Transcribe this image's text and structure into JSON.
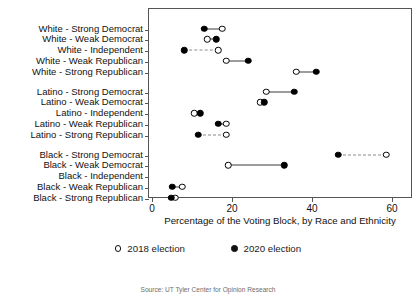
{
  "chart_data": {
    "type": "scatter",
    "subtype": "dumbbell",
    "title": "",
    "xlabel": "Percentage of the Voting Block, by Race and Ethnicity",
    "ylabel": "",
    "xlim": [
      0,
      62
    ],
    "xticks": [
      0,
      20,
      40,
      60
    ],
    "xticklabels": [
      "0",
      "20",
      "40",
      "60"
    ],
    "grid": false,
    "legend_position": "bottom",
    "source_note": "Source: UT Tyler Center for Opinion Research",
    "series": [
      {
        "name": "2018 election",
        "marker": "open-circle",
        "color": "#ffffff"
      },
      {
        "name": "2020 election",
        "marker": "filled-circle",
        "color": "#000000"
      }
    ],
    "categories": [
      "White - Strong Democrat",
      "White - Weak Democrat",
      "White - Independent",
      "White - Weak Republican",
      "White - Strong Republican",
      "Latino - Strong Democrat",
      "Latino - Weak Democrat",
      "Latino - Independent",
      "Latino - Weak Republican",
      "Latino - Strong Republican",
      "Black - Strong Democrat",
      "Black - Weak Democrat",
      "Black - Independent",
      "Black - Weak Republican",
      "Black - Strong Republican"
    ],
    "rows": [
      {
        "label": "White - Strong Democrat",
        "group": "White",
        "v2018": 17.5,
        "v2020": 13.0,
        "line": "solid"
      },
      {
        "label": "White - Weak Democrat",
        "group": "White",
        "v2018": 13.8,
        "v2020": 16.0,
        "line": "solid"
      },
      {
        "label": "White - Independent",
        "group": "White",
        "v2018": 16.5,
        "v2020": 8.0,
        "line": "dashed"
      },
      {
        "label": "White - Weak Republican",
        "group": "White",
        "v2018": 18.5,
        "v2020": 24.0,
        "line": "solid"
      },
      {
        "label": "White - Strong Republican",
        "group": "White",
        "v2018": 36.0,
        "v2020": 41.0,
        "line": "solid"
      },
      {
        "label": "Latino - Strong Democrat",
        "group": "Latino",
        "v2018": 28.5,
        "v2020": 35.5,
        "line": "solid"
      },
      {
        "label": "Latino - Weak Democrat",
        "group": "Latino",
        "v2018": 27.0,
        "v2020": 28.0,
        "line": "solid"
      },
      {
        "label": "Latino - Independent",
        "group": "Latino",
        "v2018": 10.5,
        "v2020": 12.0,
        "line": "solid"
      },
      {
        "label": "Latino - Weak Republican",
        "group": "Latino",
        "v2018": 18.5,
        "v2020": 16.5,
        "line": "solid"
      },
      {
        "label": "Latino - Strong Republican",
        "group": "Latino",
        "v2018": 18.5,
        "v2020": 11.5,
        "line": "dashed"
      },
      {
        "label": "Black - Strong Democrat",
        "group": "Black",
        "v2018": 58.5,
        "v2020": 46.5,
        "line": "dashed"
      },
      {
        "label": "Black - Weak Democrat",
        "group": "Black",
        "v2018": 19.0,
        "v2020": 33.0,
        "line": "solid"
      },
      {
        "label": "Black - Independent",
        "group": "Black",
        "v2018": null,
        "v2020": null,
        "line": "none"
      },
      {
        "label": "Black - Weak Republican",
        "group": "Black",
        "v2018": 7.5,
        "v2020": 5.0,
        "line": "solid"
      },
      {
        "label": "Black - Strong Republican",
        "group": "Black",
        "v2018": 5.8,
        "v2020": 4.8,
        "line": "solid"
      }
    ]
  },
  "legend": {
    "items": [
      {
        "label": "2018 election",
        "marker": "open"
      },
      {
        "label": "2020 election",
        "marker": "filled"
      }
    ]
  }
}
